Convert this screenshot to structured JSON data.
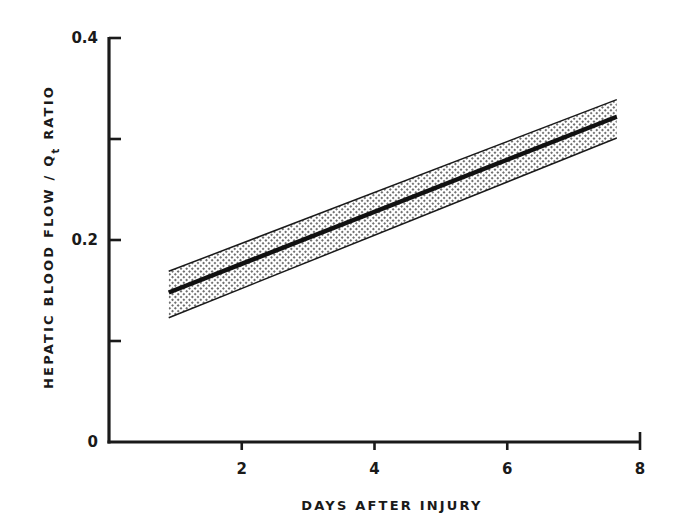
{
  "chart_data": {
    "type": "line",
    "title": "",
    "xlabel": "DAYS AFTER INJURY",
    "ylabel": "HEPATIC BLOOD FLOW / Qt RATIO",
    "ylabel_parts": {
      "pre": "HEPATIC BLOOD FLOW / Q",
      "sub": "t",
      "post": " RATIO"
    },
    "xlim": [
      0,
      8
    ],
    "ylim": [
      0,
      0.4
    ],
    "xticks": [
      2,
      4,
      6,
      8
    ],
    "xtick_labels": [
      "2",
      "4",
      "6",
      "8"
    ],
    "yticks": [
      0,
      0.1,
      0.2,
      0.3,
      0.4
    ],
    "ytick_labels": [
      "0",
      "",
      "0.2",
      "",
      "0.4"
    ],
    "grid": false,
    "legend": null,
    "series": [
      {
        "name": "mean regression line",
        "x": [
          0.9,
          7.65
        ],
        "y": [
          0.148,
          0.322
        ],
        "style": "thick-solid"
      },
      {
        "name": "upper confidence bound",
        "x": [
          0.9,
          7.65
        ],
        "y": [
          0.169,
          0.339
        ],
        "style": "thin-solid"
      },
      {
        "name": "lower confidence bound",
        "x": [
          0.9,
          7.65
        ],
        "y": [
          0.123,
          0.301
        ],
        "style": "thin-solid"
      }
    ],
    "band": {
      "name": "confidence band",
      "fill": "stipple",
      "between": [
        "upper confidence bound",
        "lower confidence bound"
      ]
    }
  },
  "colors": {
    "ink": "#1a1a1a",
    "background": "#ffffff",
    "stipple": "#333333"
  }
}
